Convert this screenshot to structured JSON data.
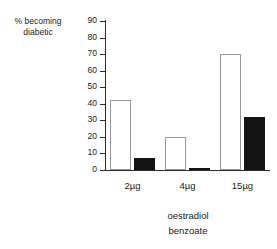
{
  "chart_data": {
    "type": "bar",
    "title": "",
    "subtitle": "",
    "xlabel_lines": [
      "oestradiol",
      "benzoate"
    ],
    "ylabel_lines": [
      "% becoming",
      "diabetic"
    ],
    "categories": [
      "2µg",
      "4µg",
      "15µg"
    ],
    "series": [
      {
        "name": "open-bar",
        "style": "white-outlined",
        "values": [
          42,
          20,
          70
        ]
      },
      {
        "name": "filled-bar",
        "style": "black-filled",
        "values": [
          7,
          1,
          32
        ]
      }
    ],
    "ylim": [
      0,
      90
    ],
    "ytick_values": [
      0,
      10,
      20,
      30,
      40,
      50,
      60,
      70,
      80,
      90
    ],
    "ytick_labels": [
      "0",
      "10",
      "20",
      "30",
      "40",
      "50",
      "60",
      "70",
      "80",
      "90"
    ],
    "grid": false,
    "legend": "none",
    "axis_color": "#2b2b2b",
    "open_bar_border_color": "#9a9a9a",
    "open_bar_fill_color": "#ffffff",
    "filled_bar_color": "#141414",
    "background_color": "#ffffff"
  }
}
